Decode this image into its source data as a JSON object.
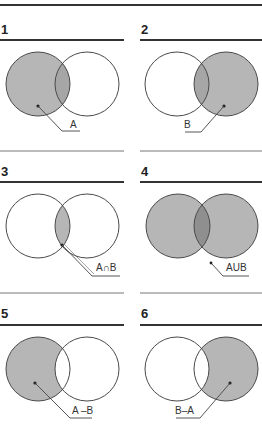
{
  "colors": {
    "stroke": "#4a4a4a",
    "fill": "#b6b6b6",
    "overlap_fill": "#8f8f8f",
    "panel1_overlap": "#a6a6a6",
    "rule": "#333333"
  },
  "panels": [
    {
      "number": "1",
      "label": "A",
      "shaded": "A"
    },
    {
      "number": "2",
      "label": "B",
      "shaded": "B"
    },
    {
      "number": "3",
      "label": "A∩B",
      "shaded": "A intersection B"
    },
    {
      "number": "4",
      "label": "AUB",
      "shaded": "A union B"
    },
    {
      "number": "5",
      "label": "A –B",
      "shaded": "A minus B"
    },
    {
      "number": "6",
      "label": "B–A",
      "shaded": "B minus A"
    }
  ]
}
